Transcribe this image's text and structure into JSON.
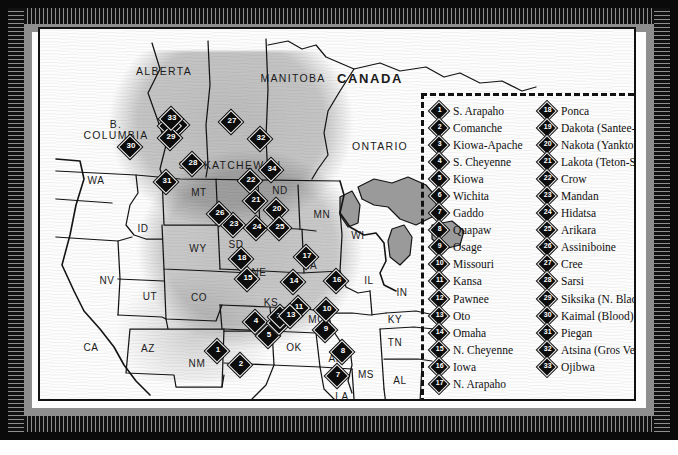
{
  "map": {
    "title": "Great Plains Culture Area Tribal Distribution Map",
    "countries": [
      {
        "name": "CANADA",
        "x": 330,
        "y": 49
      }
    ],
    "provinces": [
      {
        "name": "ALBERTA",
        "x": 124,
        "y": 42
      },
      {
        "name": "B.",
        "x": 76,
        "y": 95
      },
      {
        "name": "COLUMBIA",
        "x": 76,
        "y": 106
      },
      {
        "name": "SASKATCHEWAN",
        "x": 190,
        "y": 136
      },
      {
        "name": "MANITOBA",
        "x": 253,
        "y": 49
      },
      {
        "name": "ONTARIO",
        "x": 340,
        "y": 117
      }
    ],
    "states": [
      {
        "name": "WA",
        "x": 56,
        "y": 151
      },
      {
        "name": "MT",
        "x": 159,
        "y": 163
      },
      {
        "name": "ND",
        "x": 240,
        "y": 161
      },
      {
        "name": "MN",
        "x": 282,
        "y": 185
      },
      {
        "name": "ID",
        "x": 103,
        "y": 199
      },
      {
        "name": "WY",
        "x": 158,
        "y": 219
      },
      {
        "name": "SD",
        "x": 196,
        "y": 215
      },
      {
        "name": "WI",
        "x": 318,
        "y": 206
      },
      {
        "name": "NV",
        "x": 67,
        "y": 251
      },
      {
        "name": "NE",
        "x": 219,
        "y": 243
      },
      {
        "name": "IA",
        "x": 272,
        "y": 236
      },
      {
        "name": "IL",
        "x": 329,
        "y": 251
      },
      {
        "name": "IN",
        "x": 362,
        "y": 263
      },
      {
        "name": "UT",
        "x": 110,
        "y": 267
      },
      {
        "name": "CO",
        "x": 159,
        "y": 268
      },
      {
        "name": "KS",
        "x": 231,
        "y": 273
      },
      {
        "name": "MO",
        "x": 277,
        "y": 290
      },
      {
        "name": "KY",
        "x": 355,
        "y": 290
      },
      {
        "name": "CA",
        "x": 51,
        "y": 318
      },
      {
        "name": "AZ",
        "x": 108,
        "y": 319
      },
      {
        "name": "NM",
        "x": 157,
        "y": 334
      },
      {
        "name": "OK",
        "x": 254,
        "y": 318
      },
      {
        "name": "AR",
        "x": 296,
        "y": 329
      },
      {
        "name": "TN",
        "x": 355,
        "y": 313
      },
      {
        "name": "MS",
        "x": 326,
        "y": 345
      },
      {
        "name": "AL",
        "x": 360,
        "y": 351
      },
      {
        "name": "LA",
        "x": 302,
        "y": 367
      },
      {
        "name": "TX",
        "x": 255,
        "y": 385
      }
    ],
    "markers": [
      {
        "n": "1",
        "x": 177,
        "y": 322
      },
      {
        "n": "2",
        "x": 200,
        "y": 336
      },
      {
        "n": "3",
        "x": 137,
        "y": 96
      },
      {
        "n": "4",
        "x": 215,
        "y": 293
      },
      {
        "n": "5",
        "x": 228,
        "y": 307
      },
      {
        "n": "6",
        "x": 239,
        "y": 294
      },
      {
        "n": "7",
        "x": 297,
        "y": 347
      },
      {
        "n": "8",
        "x": 302,
        "y": 323
      },
      {
        "n": "9",
        "x": 285,
        "y": 301
      },
      {
        "n": "10",
        "x": 286,
        "y": 281
      },
      {
        "n": "11",
        "x": 258,
        "y": 279
      },
      {
        "n": "12",
        "x": 240,
        "y": 288
      },
      {
        "n": "13",
        "x": 250,
        "y": 287
      },
      {
        "n": "14",
        "x": 253,
        "y": 253
      },
      {
        "n": "15",
        "x": 207,
        "y": 250
      },
      {
        "n": "16",
        "x": 296,
        "y": 252
      },
      {
        "n": "17",
        "x": 266,
        "y": 228
      },
      {
        "n": "18",
        "x": 201,
        "y": 230
      },
      {
        "n": "19",
        "x": 130,
        "y": 97
      },
      {
        "n": "20",
        "x": 236,
        "y": 181
      },
      {
        "n": "21",
        "x": 215,
        "y": 172
      },
      {
        "n": "22",
        "x": 210,
        "y": 152
      },
      {
        "n": "23",
        "x": 193,
        "y": 196
      },
      {
        "n": "24",
        "x": 216,
        "y": 199
      },
      {
        "n": "25",
        "x": 239,
        "y": 199
      },
      {
        "n": "26",
        "x": 179,
        "y": 185
      },
      {
        "n": "27",
        "x": 191,
        "y": 93
      },
      {
        "n": "28",
        "x": 152,
        "y": 135
      },
      {
        "n": "29",
        "x": 130,
        "y": 109
      },
      {
        "n": "30",
        "x": 90,
        "y": 118
      },
      {
        "n": "31",
        "x": 126,
        "y": 153
      },
      {
        "n": "32",
        "x": 220,
        "y": 110
      },
      {
        "n": "33",
        "x": 131,
        "y": 90
      },
      {
        "n": "34",
        "x": 231,
        "y": 141
      }
    ]
  },
  "legend": {
    "column_left": [
      {
        "n": "1",
        "label": "S. Arapaho"
      },
      {
        "n": "2",
        "label": "Comanche"
      },
      {
        "n": "3",
        "label": "Kiowa-Apache"
      },
      {
        "n": "4",
        "label": "S. Cheyenne"
      },
      {
        "n": "5",
        "label": "Kiowa"
      },
      {
        "n": "6",
        "label": "Wichita"
      },
      {
        "n": "7",
        "label": "Gaddo"
      },
      {
        "n": "8",
        "label": "Quapaw"
      },
      {
        "n": "9",
        "label": "Osage"
      },
      {
        "n": "10",
        "label": "Missouri"
      },
      {
        "n": "11",
        "label": "Kansa"
      },
      {
        "n": "12",
        "label": "Pawnee"
      },
      {
        "n": "13",
        "label": "Oto"
      },
      {
        "n": "14",
        "label": "Omaha"
      },
      {
        "n": "15",
        "label": "N. Cheyenne"
      },
      {
        "n": "16",
        "label": "Iowa"
      },
      {
        "n": "17",
        "label": "N. Arapaho"
      }
    ],
    "column_right": [
      {
        "n": "18",
        "label": "Ponca"
      },
      {
        "n": "19",
        "label": "Dakota (Santee-Sioux)"
      },
      {
        "n": "20",
        "label": "Nakota (Yankton-Sioux)"
      },
      {
        "n": "21",
        "label": "Lakota (Teton-Sioux)"
      },
      {
        "n": "22",
        "label": "Crow"
      },
      {
        "n": "23",
        "label": "Mandan"
      },
      {
        "n": "24",
        "label": "Hidatsa"
      },
      {
        "n": "25",
        "label": "Arikara"
      },
      {
        "n": "26",
        "label": "Assiniboine"
      },
      {
        "n": "27",
        "label": "Cree"
      },
      {
        "n": "28",
        "label": "Sarsi"
      },
      {
        "n": "29",
        "label": "Siksika (N. Blackfoot)"
      },
      {
        "n": "30",
        "label": "Kaimal (Blood)"
      },
      {
        "n": "31",
        "label": "Piegan"
      },
      {
        "n": "32",
        "label": "Atsina (Gros Ventre)"
      },
      {
        "n": "33",
        "label": "Ojibwa"
      }
    ]
  },
  "colors": {
    "frame": "#0a0a0a",
    "saw": "#8e8e8e",
    "paper": "#fdfdfd",
    "ink": "#141414",
    "marker": "#0d0d0d",
    "water": "#9a9a9a"
  }
}
